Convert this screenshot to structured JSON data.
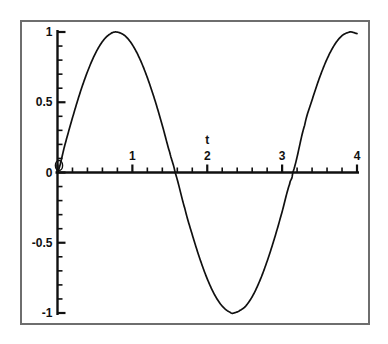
{
  "figure": {
    "background_color": "#ffffff",
    "frame_color": "#6e6e6e",
    "ink_color": "#101010"
  },
  "chart_data": {
    "type": "line",
    "title": "",
    "subtitle": "",
    "xlabel": "t",
    "ylabel": "",
    "xlim": [
      0,
      4
    ],
    "ylim": [
      -1,
      1
    ],
    "grid": false,
    "legend": "none",
    "series": [
      {
        "name": "sin(2t)",
        "expression": "sin(2t)",
        "color": "#101010",
        "x": [
          0,
          0.1,
          0.2,
          0.3,
          0.4,
          0.5,
          0.6,
          0.7,
          0.785,
          0.9,
          1.0,
          1.1,
          1.2,
          1.3,
          1.4,
          1.5,
          1.571,
          1.7,
          1.8,
          1.9,
          2.0,
          2.1,
          2.2,
          2.3,
          2.356,
          2.5,
          2.6,
          2.7,
          2.8,
          2.9,
          3.0,
          3.1,
          3.142,
          3.3,
          3.4,
          3.5,
          3.6,
          3.7,
          3.8,
          3.9,
          3.927,
          4.0
        ],
        "y": [
          0,
          0.199,
          0.389,
          0.565,
          0.717,
          0.841,
          0.932,
          0.985,
          1.0,
          0.974,
          0.909,
          0.808,
          0.675,
          0.516,
          0.335,
          0.141,
          0,
          -0.255,
          -0.443,
          -0.612,
          -0.757,
          -0.872,
          -0.951,
          -0.993,
          -1.0,
          -0.959,
          -0.884,
          -0.773,
          -0.631,
          -0.465,
          -0.279,
          -0.083,
          0,
          0.335,
          0.516,
          0.675,
          0.808,
          0.909,
          0.974,
          0.999,
          1.0,
          0.989
        ]
      }
    ],
    "x_major_ticks": [
      0,
      1,
      2,
      3,
      4
    ],
    "x_major_tick_labels": [
      "0",
      "1",
      "2",
      "3",
      "4"
    ],
    "x_minor_tick_step": 0.2,
    "y_major_ticks": [
      -1,
      -0.5,
      0,
      0.5,
      1
    ],
    "y_major_tick_labels": [
      "-1",
      "-0.5",
      "0",
      "0.5",
      "1"
    ],
    "y_minor_tick_step": 0.1,
    "origin_marker": "0"
  }
}
